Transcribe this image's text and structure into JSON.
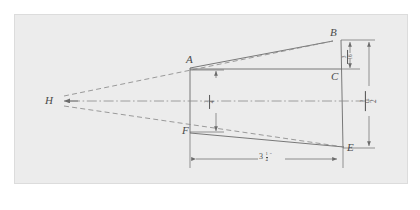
{
  "figure": {
    "kind": "engineering-drawing",
    "background_color": "#ececec",
    "page_color": "#ffffff",
    "line_color": "#6b6b6b",
    "text_color": "#4a4a4a"
  },
  "points": {
    "H": {
      "label": "H",
      "x": 55,
      "y": 101
    },
    "A": {
      "label": "A",
      "x": 190,
      "y": 68
    },
    "B": {
      "label": "B",
      "x": 333,
      "y": 38
    },
    "C": {
      "label": "C",
      "x": 336,
      "y": 77
    },
    "E": {
      "label": "E",
      "x": 345,
      "y": 148
    },
    "F": {
      "label": "F",
      "x": 190,
      "y": 133
    }
  },
  "dimensions": {
    "horizontal": {
      "name": "overall-length",
      "whole": "3",
      "numerator": "1",
      "denominator": "4",
      "unit": "″",
      "text": "3 1/4″"
    },
    "taper_offset": {
      "name": "taper-offset",
      "numerator": "3",
      "denominator": "16",
      "text": "3/16"
    },
    "front_height": {
      "name": "front-height",
      "numerator": "1",
      "denominator": "4",
      "text": "1/4"
    },
    "rear_height": {
      "name": "rear-height",
      "whole": "2",
      "numerator": "3",
      "denominator": "16",
      "text": "2 3/16"
    }
  }
}
